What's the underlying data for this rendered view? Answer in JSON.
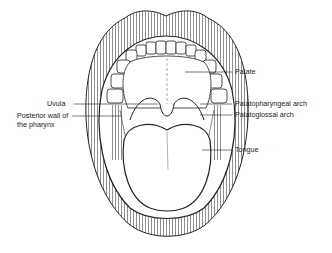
{
  "diagram": {
    "labels": {
      "palate": "Palate",
      "palatopharyngeal_arch": "Palatopharyngeal arch",
      "palatoglossal_arch": "Palatoglossal arch",
      "tongue": "Tongue",
      "uvula": "Uvula",
      "posterior_wall_line1": "Posterior wall of",
      "posterior_wall_line2": "the pharynx"
    },
    "colors": {
      "line": "#222222",
      "background": "#ffffff"
    }
  }
}
